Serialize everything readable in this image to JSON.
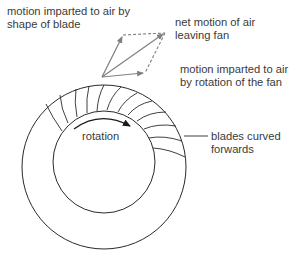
{
  "diagram": {
    "labels": {
      "blade_shape": "motion imparted to air by\nshape of blade",
      "net_motion": "net motion of air\nleaving fan",
      "rotation_motion": "motion imparted to air\nby rotation of the fan",
      "rotation": "rotation",
      "blades": "blades curved\nforwards"
    },
    "colors": {
      "line": "#2a2a2a",
      "vector": "#808080",
      "text": "#3a3a3a"
    }
  }
}
